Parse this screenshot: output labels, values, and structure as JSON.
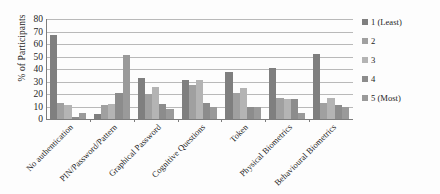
{
  "chart_data": {
    "type": "bar",
    "title": "",
    "xlabel": "",
    "ylabel": "% of Participants",
    "ylim": [
      0,
      80
    ],
    "yticks": [
      0,
      10,
      20,
      30,
      40,
      50,
      60,
      70,
      80
    ],
    "grid": true,
    "legend_position": "right",
    "categories": [
      "No authentication",
      "PIN/Password/Pattern",
      "Graphical Password",
      "Cognitive Questions",
      "Token",
      "Physical Biometrics",
      "Behavioural Biometrics"
    ],
    "series": [
      {
        "name": "1 (Least)",
        "color": "#7f7f7f",
        "values": [
          67,
          4,
          33,
          31,
          38,
          41,
          52
        ]
      },
      {
        "name": "2",
        "color": "#a0a0a0",
        "values": [
          13,
          11,
          20,
          27,
          21,
          17,
          13
        ]
      },
      {
        "name": "3",
        "color": "#b4b4b4",
        "values": [
          11,
          12,
          26,
          31,
          25,
          16,
          17
        ]
      },
      {
        "name": "4",
        "color": "#8c8c8c",
        "values": [
          2,
          21,
          12,
          13,
          10,
          16,
          11
        ]
      },
      {
        "name": "5 (Most)",
        "color": "#9a9a9a",
        "values": [
          5,
          51,
          8,
          10,
          10,
          5,
          10
        ]
      }
    ]
  },
  "accessibility": {
    "figure_name": "authentication-preference-bar-chart"
  }
}
